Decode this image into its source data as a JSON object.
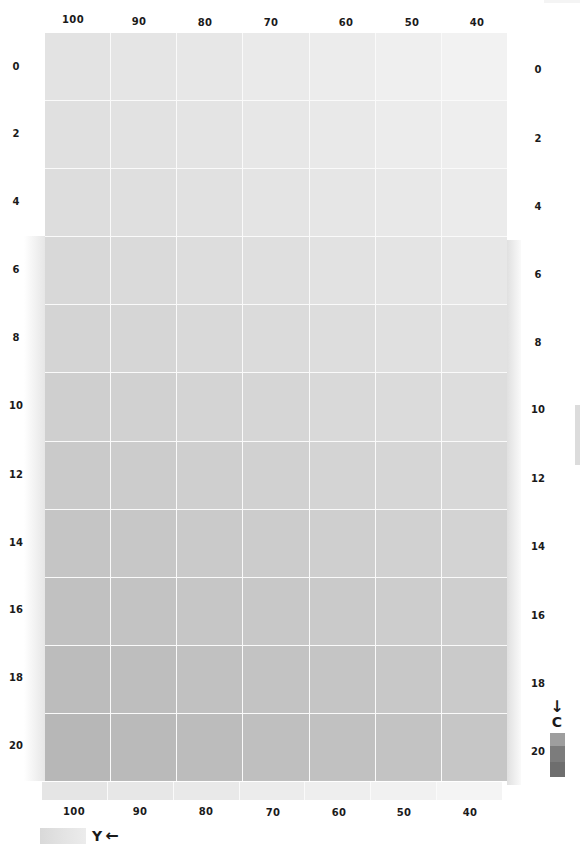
{
  "chart_data": {
    "type": "heatmap",
    "title": "",
    "xlabel": "Y",
    "ylabel": "C",
    "x_direction": "decreasing-left-to-right",
    "y_direction": "increasing-top-to-bottom",
    "columns": [
      "100",
      "90",
      "80",
      "70",
      "60",
      "50",
      "40"
    ],
    "rows": [
      "0",
      "2",
      "4",
      "6",
      "8",
      "10",
      "12",
      "14",
      "16",
      "18",
      "20"
    ],
    "grid": true,
    "legend": {
      "x_axis": {
        "label": "Y",
        "arrow": "←",
        "position": "bottom-left"
      },
      "y_axis": {
        "label": "C",
        "arrow": "↓",
        "position": "bottom-right"
      }
    },
    "corner_colors": {
      "top_left": "#e3e3e3",
      "top_right": "#f2f2f2",
      "bottom_left": "#b7b7b7",
      "bottom_right": "#c6c6c6"
    },
    "values_gray_level": [
      [
        227,
        229,
        231,
        234,
        236,
        239,
        242
      ],
      [
        224,
        226,
        228,
        231,
        233,
        236,
        238
      ],
      [
        221,
        223,
        225,
        228,
        230,
        232,
        235
      ],
      [
        216,
        218,
        221,
        223,
        226,
        228,
        231
      ],
      [
        212,
        214,
        217,
        219,
        221,
        224,
        226
      ],
      [
        207,
        209,
        212,
        214,
        217,
        219,
        221
      ],
      [
        202,
        204,
        207,
        209,
        212,
        214,
        216
      ],
      [
        197,
        199,
        202,
        204,
        207,
        209,
        211
      ],
      [
        193,
        195,
        198,
        200,
        202,
        205,
        207
      ],
      [
        188,
        190,
        193,
        195,
        197,
        200,
        202
      ],
      [
        183,
        186,
        188,
        191,
        193,
        195,
        198
      ]
    ]
  },
  "top_axis": {
    "labels": [
      "100",
      "90",
      "80",
      "70",
      "60",
      "50",
      "40"
    ]
  },
  "bottom_axis": {
    "labels": [
      "100",
      "90",
      "80",
      "70",
      "60",
      "50",
      "40"
    ]
  },
  "left_axis": {
    "labels": [
      "0",
      "2",
      "4",
      "6",
      "8",
      "10",
      "12",
      "14",
      "16",
      "18",
      "20"
    ]
  },
  "right_axis": {
    "labels": [
      "0",
      "2",
      "4",
      "6",
      "8",
      "10",
      "12",
      "14",
      "16",
      "18",
      "20"
    ]
  },
  "legend_y": {
    "label": "Y",
    "arrow": "🡐"
  },
  "legend_c": {
    "label": "C",
    "arrow": "🡓"
  }
}
